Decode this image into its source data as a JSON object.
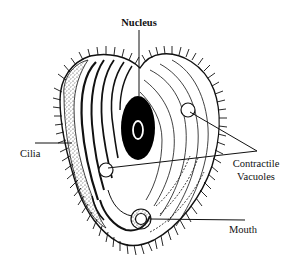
{
  "diagram": {
    "labels": {
      "nucleus": "Nucleus",
      "cilia": "Cilia",
      "contractile_line1": "Contractile",
      "contractile_line2": "Vacuoles",
      "mouth": "Mouth"
    },
    "colors": {
      "ink": "#111111",
      "background": "#ffffff",
      "nucleus_fill": "#000000"
    }
  }
}
